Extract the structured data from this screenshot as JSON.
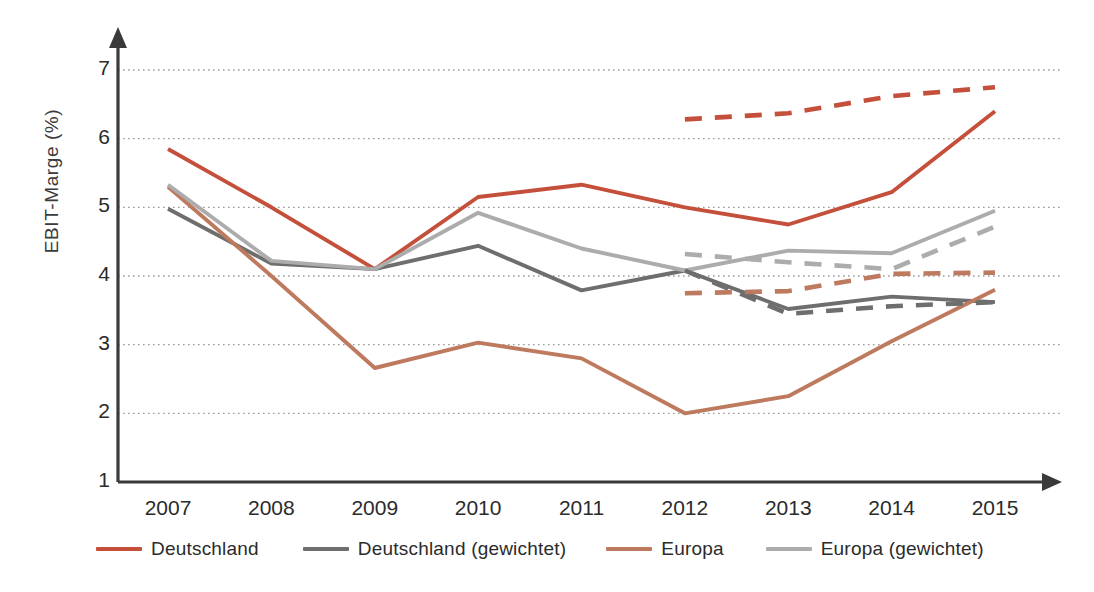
{
  "chart_data": {
    "type": "line",
    "title": "",
    "xlabel": "",
    "ylabel": "EBIT-Marge (%)",
    "categories": [
      2007,
      2008,
      2009,
      2010,
      2011,
      2012,
      2013,
      2014,
      2015
    ],
    "xtick_labels": [
      "2007",
      "2008",
      "2009",
      "2010",
      "2011",
      "2012",
      "2013",
      "2014",
      "2015"
    ],
    "ytick_labels": [
      "7",
      "6",
      "5",
      "4",
      "3",
      "2",
      "1"
    ],
    "ytick_values": [
      7,
      6,
      5,
      4,
      3,
      2,
      1
    ],
    "ylim": [
      1,
      7
    ],
    "xlim": [
      2007,
      2015
    ],
    "grid": "horizontal-dotted",
    "legend_position": "bottom",
    "series": [
      {
        "name": "Deutschland",
        "color": "#C4503C",
        "style": "solid",
        "x": [
          2007,
          2008,
          2009,
          2010,
          2011,
          2012,
          2013,
          2014,
          2015
        ],
        "values": [
          5.85,
          5.0,
          4.1,
          5.15,
          5.33,
          5.0,
          4.75,
          5.22,
          6.4
        ]
      },
      {
        "name": "Deutschland (gewichtet)",
        "color": "#6E6E6E",
        "style": "solid",
        "x": [
          2007,
          2008,
          2009,
          2010,
          2011,
          2012,
          2013,
          2014,
          2015
        ],
        "values": [
          4.98,
          4.18,
          4.1,
          4.44,
          3.79,
          4.08,
          3.52,
          3.7,
          3.62
        ]
      },
      {
        "name": "Europa",
        "color": "#BE7A5E",
        "style": "solid",
        "x": [
          2007,
          2008,
          2009,
          2010,
          2011,
          2012,
          2013,
          2014,
          2015
        ],
        "values": [
          5.3,
          4.0,
          2.66,
          3.03,
          2.8,
          2.0,
          2.25,
          3.05,
          3.8
        ]
      },
      {
        "name": "Europa (gewichtet)",
        "color": "#ACACAC",
        "style": "solid",
        "x": [
          2007,
          2008,
          2009,
          2010,
          2011,
          2012,
          2013,
          2014,
          2015
        ],
        "values": [
          5.33,
          4.22,
          4.1,
          4.92,
          4.4,
          4.08,
          4.37,
          4.33,
          4.95
        ]
      },
      {
        "name": "Deutschland (Prognose)",
        "color": "#C4503C",
        "style": "dashed",
        "x": [
          2012,
          2013,
          2014,
          2015
        ],
        "values": [
          6.28,
          6.37,
          6.62,
          6.75
        ]
      },
      {
        "name": "Deutschland (gewichtet, Prognose)",
        "color": "#6E6E6E",
        "style": "dashed",
        "x": [
          2012,
          2013,
          2014,
          2015
        ],
        "values": [
          4.08,
          3.45,
          3.56,
          3.62
        ]
      },
      {
        "name": "Europa (Prognose)",
        "color": "#BE7A5E",
        "style": "dashed",
        "x": [
          2012,
          2013,
          2014,
          2015
        ],
        "values": [
          3.75,
          3.78,
          4.03,
          4.05
        ]
      },
      {
        "name": "Europa (gewichtet, Prognose)",
        "color": "#ACACAC",
        "style": "dashed",
        "x": [
          2012,
          2013,
          2014,
          2015
        ],
        "values": [
          4.32,
          4.2,
          4.1,
          4.72
        ]
      }
    ]
  },
  "legend": {
    "items": [
      {
        "label": "Deutschland",
        "color": "#C4503C"
      },
      {
        "label": "Deutschland (gewichtet)",
        "color": "#6E6E6E"
      },
      {
        "label": "Europa",
        "color": "#BE7A5E"
      },
      {
        "label": "Europa (gewichtet)",
        "color": "#ACACAC"
      }
    ]
  },
  "axes": {
    "y_title": "EBIT-Marge (%)"
  }
}
